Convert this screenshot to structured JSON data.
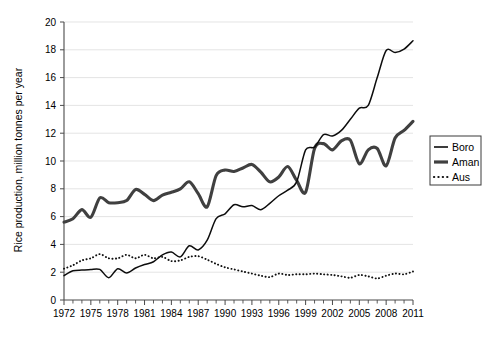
{
  "chart_data": {
    "type": "line",
    "title": "",
    "xlabel": "",
    "ylabel": "Rice production, million tonnes per year",
    "xlim": [
      1972,
      2011
    ],
    "ylim": [
      0,
      20
    ],
    "grid": true,
    "legend_position": "right-outside",
    "x": [
      1972,
      1973,
      1974,
      1975,
      1976,
      1977,
      1978,
      1979,
      1980,
      1981,
      1982,
      1983,
      1984,
      1985,
      1986,
      1987,
      1988,
      1989,
      1990,
      1991,
      1992,
      1993,
      1994,
      1995,
      1996,
      1997,
      1998,
      1999,
      2000,
      2001,
      2002,
      2003,
      2004,
      2005,
      2006,
      2007,
      2008,
      2009,
      2010,
      2011
    ],
    "x_tick_labels": [
      "1972",
      "1975",
      "1978",
      "1981",
      "1984",
      "1987",
      "1990",
      "1993",
      "1996",
      "1999",
      "2002",
      "2005",
      "2008",
      "2011"
    ],
    "x_tick_values": [
      1972,
      1975,
      1978,
      1981,
      1984,
      1987,
      1990,
      1993,
      1996,
      1999,
      2002,
      2005,
      2008,
      2011
    ],
    "y_tick_labels": [
      "0",
      "2",
      "4",
      "6",
      "8",
      "10",
      "12",
      "14",
      "16",
      "18",
      "20"
    ],
    "y_tick_values": [
      0,
      2,
      4,
      6,
      8,
      10,
      12,
      14,
      16,
      18,
      20
    ],
    "series": [
      {
        "name": "Boro",
        "style": "solid-thin",
        "color": "#0d0d0d",
        "values": [
          1.75,
          2.1,
          2.15,
          2.2,
          2.2,
          1.6,
          2.25,
          1.95,
          2.3,
          2.55,
          2.75,
          3.25,
          3.45,
          3.1,
          3.9,
          3.6,
          4.3,
          5.85,
          6.2,
          6.85,
          6.7,
          6.8,
          6.5,
          6.95,
          7.5,
          7.9,
          8.5,
          10.8,
          11.0,
          11.9,
          11.8,
          12.2,
          13.0,
          13.8,
          14.0,
          16.0,
          17.95,
          17.8,
          18.05,
          18.65
        ]
      },
      {
        "name": "Aman",
        "style": "solid-thick",
        "color": "#404040",
        "values": [
          5.6,
          5.85,
          6.5,
          5.95,
          7.35,
          7.0,
          7.0,
          7.15,
          7.95,
          7.6,
          7.15,
          7.55,
          7.75,
          8.0,
          8.5,
          7.65,
          6.7,
          8.95,
          9.35,
          9.25,
          9.5,
          9.75,
          9.2,
          8.5,
          8.85,
          9.6,
          8.6,
          7.75,
          10.9,
          11.25,
          10.8,
          11.45,
          11.5,
          9.8,
          10.8,
          10.9,
          9.65,
          11.65,
          12.2,
          12.85
        ]
      },
      {
        "name": "Aus",
        "style": "dotted",
        "color": "#111111",
        "values": [
          2.25,
          2.5,
          2.85,
          3.0,
          3.3,
          3.0,
          3.0,
          3.25,
          3.0,
          3.25,
          3.0,
          3.1,
          2.8,
          2.85,
          3.1,
          3.15,
          2.9,
          2.6,
          2.35,
          2.2,
          2.05,
          1.9,
          1.75,
          1.65,
          1.9,
          1.8,
          1.85,
          1.85,
          1.9,
          1.85,
          1.8,
          1.7,
          1.6,
          1.8,
          1.7,
          1.55,
          1.75,
          1.9,
          1.85,
          2.05
        ]
      }
    ]
  },
  "legend": {
    "items": [
      {
        "label": "Boro",
        "style": "solid-thin"
      },
      {
        "label": "Aman",
        "style": "solid-thick"
      },
      {
        "label": "Aus",
        "style": "dotted"
      }
    ]
  },
  "axis": {
    "y_title": "Rice production, million tonnes per year"
  }
}
